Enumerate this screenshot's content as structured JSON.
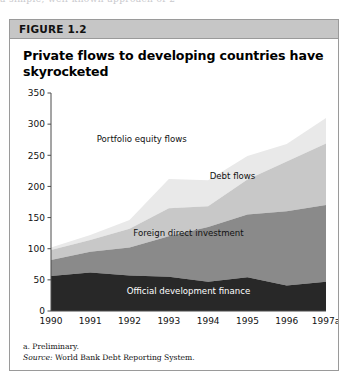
{
  "page_bleed": {
    "top_fragment": "a simple, well-known  approach  of   2"
  },
  "figure": {
    "header_label": "FIGURE 1.2",
    "title": "Private flows to developing countries have skyrocketed",
    "notes": {
      "footnote": "a. Preliminary.",
      "source_prefix": "Source:",
      "source_text": "World Bank Debt Reporting System."
    }
  },
  "chart_data": {
    "type": "area",
    "stacked": true,
    "title": "Private flows to developing countries have skyrocketed",
    "xlabel": "",
    "ylabel": "",
    "ylim": [
      0,
      350
    ],
    "ytick_step": 50,
    "yticks": [
      0,
      50,
      100,
      150,
      200,
      250,
      300,
      350
    ],
    "grid": false,
    "legend_position": "inline-annotations",
    "categories": [
      "1990",
      "1991",
      "1992",
      "1993",
      "1994",
      "1995",
      "1996",
      "1997a"
    ],
    "series": [
      {
        "name": "Official development finance",
        "color": "#282828",
        "values": [
          56,
          62,
          57,
          55,
          47,
          54,
          41,
          47
        ]
      },
      {
        "name": "Foreign direct investment",
        "color": "#8a8a8a",
        "values": [
          26,
          33,
          45,
          65,
          88,
          101,
          119,
          123
        ]
      },
      {
        "name": "Debt flows",
        "color": "#c8c8c8",
        "values": [
          16,
          19,
          30,
          45,
          33,
          56,
          80,
          99
        ]
      },
      {
        "name": "Portfolio equity flows",
        "color": "#e9e9e9",
        "values": [
          4,
          8,
          14,
          47,
          42,
          38,
          28,
          41
        ]
      }
    ],
    "cumulative_tops": {
      "official_development_finance": [
        56,
        62,
        57,
        55,
        47,
        54,
        41,
        47
      ],
      "plus_foreign_direct_investment": [
        82,
        95,
        102,
        120,
        135,
        155,
        160,
        170
      ],
      "plus_debt_flows": [
        98,
        114,
        132,
        165,
        168,
        211,
        240,
        269
      ],
      "total": [
        102,
        122,
        146,
        212,
        210,
        249,
        268,
        310
      ]
    },
    "annotations": [
      {
        "text": "Portfolio equity flows",
        "x_frac": 0.33,
        "value": 272
      },
      {
        "text": "Debt flows",
        "x_frac": 0.66,
        "value": 212
      },
      {
        "text": "Foreign direct investment",
        "x_frac": 0.5,
        "value": 120
      },
      {
        "text": "Official development finance",
        "x_frac": 0.5,
        "value": 27
      }
    ]
  }
}
